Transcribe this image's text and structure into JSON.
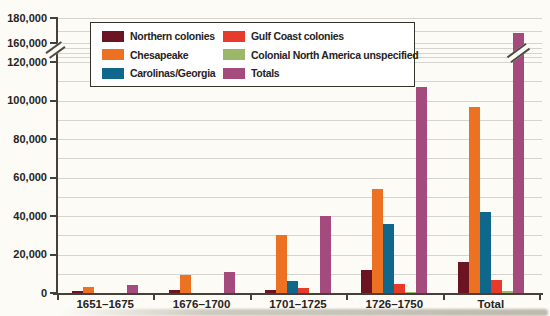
{
  "figure": {
    "y_axis_ticks": [
      {
        "value": 0,
        "label": "0"
      },
      {
        "value": 20000,
        "label": "20,000"
      },
      {
        "value": 40000,
        "label": "40,000"
      },
      {
        "value": 60000,
        "label": "60,000"
      },
      {
        "value": 80000,
        "label": "80,000"
      },
      {
        "value": 100000,
        "label": "100,000"
      },
      {
        "value": 120000,
        "label": "120,000"
      },
      {
        "value": 160000,
        "label": "160,000"
      },
      {
        "value": 180000,
        "label": "180,000"
      }
    ],
    "gridline_values": [
      10000,
      20000,
      30000,
      40000,
      50000,
      60000,
      70000,
      80000,
      90000,
      100000,
      110000,
      120000,
      130000,
      140000,
      150000,
      160000,
      170000,
      180000
    ]
  },
  "chart_data": {
    "type": "bar",
    "categories": [
      "1651–1675",
      "1676–1700",
      "1701–1725",
      "1726–1750",
      "Total"
    ],
    "series": [
      {
        "name": "Northern colonies",
        "color": "#6d1422",
        "values": [
          1000,
          1500,
          1500,
          12000,
          16000
        ]
      },
      {
        "name": "Chesapeake",
        "color": "#ec7123",
        "values": [
          3000,
          9500,
          30000,
          54000,
          96500
        ]
      },
      {
        "name": "Carolinas/Georgia",
        "color": "#0f678c",
        "values": [
          0,
          0,
          6000,
          36000,
          42000
        ]
      },
      {
        "name": "Gulf Coast colonies",
        "color": "#e73a2a",
        "values": [
          0,
          0,
          2500,
          4500,
          7000
        ]
      },
      {
        "name": "Colonial North America unspecified",
        "color": "#9bb869",
        "values": [
          0,
          0,
          0,
          500,
          1000
        ]
      },
      {
        "name": "Totals",
        "color": "#a54a7d",
        "values": [
          4000,
          11000,
          40000,
          107000,
          162500
        ]
      }
    ],
    "ylim": [
      0,
      180000
    ],
    "y_axis_break_between": [
      120000,
      160000
    ],
    "bar_break": {
      "category": "Total",
      "series": "Totals"
    },
    "grid": true,
    "legend_position": "top-left"
  }
}
